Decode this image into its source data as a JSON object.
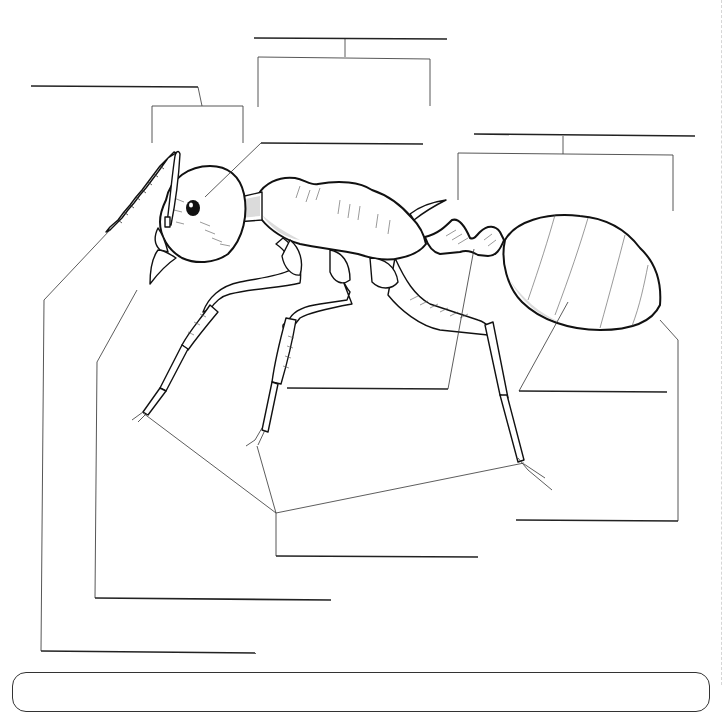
{
  "worksheet": {
    "title": "",
    "subject": "ant-anatomy-labeling",
    "answer_box_text": ""
  },
  "colors": {
    "ink": "#111111",
    "line": "#222222",
    "paper": "#ffffff",
    "margin_rule": "#d6d6d6"
  },
  "label_blanks": [
    {
      "id": "antenna-group",
      "x1": 31,
      "y1": 86,
      "x2": 198,
      "y2": 87,
      "text": ""
    },
    {
      "id": "head-group",
      "x1": 254,
      "y1": 38,
      "x2": 447,
      "y2": 39,
      "text": ""
    },
    {
      "id": "eye",
      "x1": 261,
      "y1": 143,
      "x2": 423,
      "y2": 144,
      "text": ""
    },
    {
      "id": "abdomen-group",
      "x1": 474,
      "y1": 134,
      "x2": 695,
      "y2": 136,
      "text": ""
    },
    {
      "id": "petiole",
      "x1": 287,
      "y1": 388,
      "x2": 448,
      "y2": 389,
      "text": ""
    },
    {
      "id": "gaster",
      "x1": 519,
      "y1": 391,
      "x2": 667,
      "y2": 392,
      "text": ""
    },
    {
      "id": "stinger",
      "x1": 516,
      "y1": 520,
      "x2": 678,
      "y2": 521,
      "text": ""
    },
    {
      "id": "legs",
      "x1": 276,
      "y1": 556,
      "x2": 478,
      "y2": 557,
      "text": ""
    },
    {
      "id": "mandible",
      "x1": 95,
      "y1": 598,
      "x2": 331,
      "y2": 600,
      "text": ""
    },
    {
      "id": "antenna",
      "x1": 41,
      "y1": 651,
      "x2": 256,
      "y2": 653,
      "text": ""
    }
  ]
}
